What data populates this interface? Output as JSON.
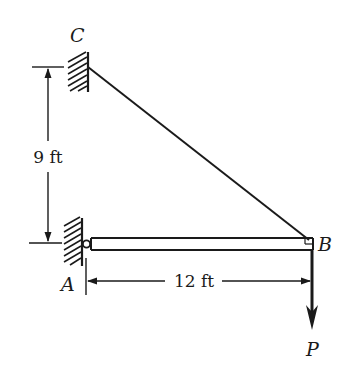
{
  "figure": {
    "type": "statics-diagram",
    "colors": {
      "ink": "#1a1a1a",
      "background": "#ffffff"
    }
  },
  "labels": {
    "point_c": "C",
    "point_a": "A",
    "point_b": "B",
    "load": "P"
  },
  "dimensions": {
    "vertical": "9 ft",
    "horizontal": "12 ft"
  },
  "elements": {
    "supports": [
      "fixed wall at C",
      "pin support at A"
    ],
    "members": [
      "beam AB",
      "cable BC"
    ],
    "loads": [
      {
        "label": "P",
        "direction": "down",
        "at": "B"
      }
    ]
  }
}
